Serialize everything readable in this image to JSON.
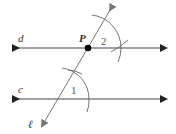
{
  "diagram": {
    "type": "geometry-construction",
    "labels": {
      "line_d": "d",
      "line_c": "c",
      "transversal": "ℓ",
      "point": "P",
      "angle_1": "1",
      "angle_2": "2"
    },
    "colors": {
      "lines": "#333333",
      "transversal": "#777777",
      "arcs": "#666666",
      "point": "#000000"
    }
  }
}
